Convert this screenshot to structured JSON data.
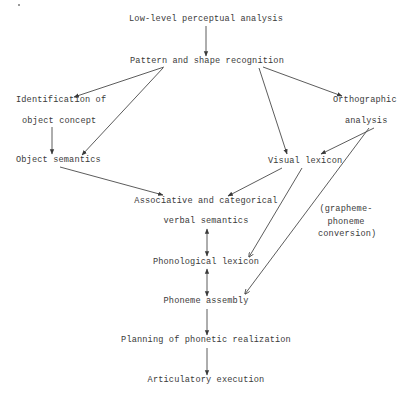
{
  "diagram": {
    "title": "",
    "nodes": {
      "perceptual": "Low-level perceptual analysis",
      "pattern": "Pattern and shape recognition",
      "identification_line1": "Identification of",
      "identification_line2": "object concept",
      "object_semantics": "Object semantics",
      "orthographic_line1": "Orthographic",
      "orthographic_line2": "analysis",
      "visual_lexicon": "Visual lexicon",
      "associative_line1": "Associative and categorical",
      "associative_line2": "verbal semantics",
      "phonological_lexicon": "Phonological lexicon",
      "phoneme_assembly": "Phoneme assembly",
      "planning": "Planning of phonetic realization",
      "articulatory": "Articulatory execution"
    },
    "annotations": {
      "gpc_line1": "(grapheme-",
      "gpc_line2": "phoneme",
      "gpc_line3": "conversion)"
    },
    "edges": [
      {
        "from": "Low-level perceptual analysis",
        "to": "Pattern and shape recognition",
        "type": "one-way"
      },
      {
        "from": "Pattern and shape recognition",
        "to": "Identification of object concept",
        "type": "one-way"
      },
      {
        "from": "Pattern and shape recognition",
        "to": "Object semantics",
        "type": "one-way"
      },
      {
        "from": "Pattern and shape recognition",
        "to": "Orthographic analysis",
        "type": "one-way"
      },
      {
        "from": "Pattern and shape recognition",
        "to": "Visual lexicon",
        "type": "one-way"
      },
      {
        "from": "Identification of object concept",
        "to": "Object semantics",
        "type": "one-way"
      },
      {
        "from": "Orthographic analysis",
        "to": "Visual lexicon",
        "type": "one-way"
      },
      {
        "from": "Orthographic analysis",
        "to": "Phoneme assembly",
        "type": "one-way",
        "label": "(grapheme-phoneme conversion)"
      },
      {
        "from": "Object semantics",
        "to": "Associative and categorical verbal semantics",
        "type": "one-way"
      },
      {
        "from": "Visual lexicon",
        "to": "Associative and categorical verbal semantics",
        "type": "one-way"
      },
      {
        "from": "Visual lexicon",
        "to": "Phonological lexicon",
        "type": "one-way"
      },
      {
        "from": "Associative and categorical verbal semantics",
        "to": "Phonological lexicon",
        "type": "two-way"
      },
      {
        "from": "Phonological lexicon",
        "to": "Phoneme assembly",
        "type": "two-way"
      },
      {
        "from": "Phoneme assembly",
        "to": "Planning of phonetic realization",
        "type": "one-way"
      },
      {
        "from": "Planning of phonetic realization",
        "to": "Articulatory execution",
        "type": "one-way"
      }
    ],
    "colors": {
      "ink": "#3a3a3a",
      "background": "#ffffff"
    }
  }
}
